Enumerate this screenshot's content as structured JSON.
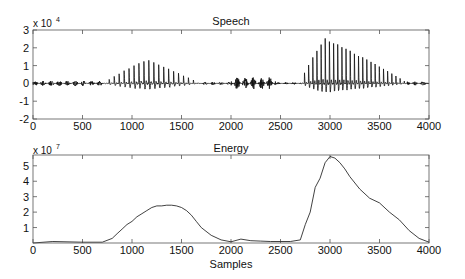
{
  "figure": {
    "width": 465,
    "height": 279,
    "background": "#ffffff",
    "line_color": "#111111",
    "axis_color": "#555555"
  },
  "chart_data": [
    {
      "type": "line",
      "title": "Speech",
      "xlabel": "",
      "ylabel": "",
      "y_multiplier_label": "x 10",
      "y_multiplier_exponent": "4",
      "xlim": [
        0,
        4000
      ],
      "ylim": [
        -2,
        3
      ],
      "x_ticks": [
        0,
        500,
        1000,
        1500,
        2000,
        2500,
        3000,
        3500,
        4000
      ],
      "x_tick_labels": [
        "0",
        "500",
        "1000",
        "1500",
        "2000",
        "2500",
        "3000",
        "3500",
        "4000"
      ],
      "y_ticks": [
        -2,
        -1,
        0,
        1,
        2,
        3
      ],
      "y_tick_labels": [
        "-2",
        "-1",
        "0",
        "1",
        "2",
        "3"
      ],
      "grid": false,
      "legend": null,
      "description": "Waveform (units x10^4): low noise 0-700; voiced burst ~750-1650 with envelope peaking ~1.3 around 1100-1300; low-amplitude dense noise burst ~2000-2450 (~±0.3); strong voiced burst ~2720-3780 peaking ~2.5 near 2950, decaying to ~0.6 by 3700; then low noise to 4000.",
      "segments": [
        {
          "name": "noise-1",
          "x_start": 0,
          "x_end": 720,
          "amp": 0.15
        },
        {
          "name": "voiced-1",
          "x_start": 720,
          "x_end": 1680,
          "peak_x": 1150,
          "peak_amp": 1.3,
          "neg_amp": -0.8
        },
        {
          "name": "noise-2",
          "x_start": 1680,
          "x_end": 2000,
          "amp": 0.08
        },
        {
          "name": "fricative",
          "x_start": 2000,
          "x_end": 2450,
          "amp": 0.35
        },
        {
          "name": "noise-3",
          "x_start": 2450,
          "x_end": 2700,
          "amp": 0.06
        },
        {
          "name": "voiced-2",
          "x_start": 2700,
          "x_end": 3780,
          "peak_x": 2950,
          "peak_amp": 2.5,
          "neg_amp": -1.15
        },
        {
          "name": "noise-4",
          "x_start": 3780,
          "x_end": 4000,
          "amp": 0.12
        }
      ]
    },
    {
      "type": "line",
      "title": "Energy",
      "xlabel": "Samples",
      "ylabel": "",
      "y_multiplier_label": "x 10",
      "y_multiplier_exponent": "7",
      "xlim": [
        0,
        4000
      ],
      "ylim": [
        0,
        5.7
      ],
      "x_ticks": [
        0,
        500,
        1000,
        1500,
        2000,
        2500,
        3000,
        3500,
        4000
      ],
      "x_tick_labels": [
        "0",
        "500",
        "1000",
        "1500",
        "2000",
        "2500",
        "3000",
        "3500",
        "4000"
      ],
      "y_ticks": [
        1,
        2,
        3,
        4,
        5
      ],
      "y_tick_labels": [
        "1",
        "2",
        "3",
        "4",
        "5"
      ],
      "grid": false,
      "legend": null,
      "x": [
        0,
        200,
        500,
        700,
        800,
        850,
        900,
        950,
        1000,
        1050,
        1100,
        1150,
        1200,
        1250,
        1300,
        1350,
        1400,
        1450,
        1500,
        1550,
        1600,
        1650,
        1700,
        1800,
        1900,
        2000,
        2100,
        2200,
        2300,
        2400,
        2500,
        2600,
        2700,
        2750,
        2800,
        2850,
        2900,
        2950,
        3000,
        3050,
        3100,
        3150,
        3200,
        3300,
        3400,
        3500,
        3600,
        3700,
        3800,
        3900,
        4000
      ],
      "values": [
        0.0,
        0.1,
        0.05,
        0.05,
        0.3,
        0.6,
        0.9,
        1.2,
        1.4,
        1.7,
        1.9,
        2.1,
        2.3,
        2.4,
        2.4,
        2.45,
        2.45,
        2.4,
        2.3,
        2.1,
        1.8,
        1.4,
        1.0,
        0.5,
        0.2,
        0.08,
        0.25,
        0.15,
        0.12,
        0.1,
        0.1,
        0.1,
        0.2,
        1.2,
        2.0,
        3.6,
        4.2,
        5.2,
        5.6,
        5.5,
        5.2,
        4.8,
        4.3,
        3.5,
        2.9,
        2.6,
        2.0,
        1.5,
        0.8,
        0.3,
        0.05
      ]
    }
  ]
}
